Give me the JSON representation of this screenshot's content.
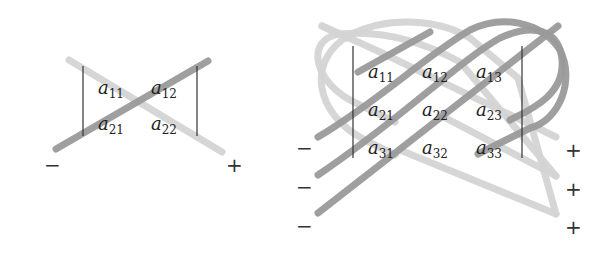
{
  "diagram_2x2": {
    "title": "2x2 determinant diagonals",
    "entries": [
      {
        "base": "a",
        "sub": "11"
      },
      {
        "base": "a",
        "sub": "12"
      },
      {
        "base": "a",
        "sub": "21"
      },
      {
        "base": "a",
        "sub": "22"
      }
    ],
    "minus_sign": "−",
    "plus_sign": "+"
  },
  "diagram_3x3": {
    "title": "3x3 determinant (Sarrus rule) diagonals",
    "entries": [
      {
        "base": "a",
        "sub": "11"
      },
      {
        "base": "a",
        "sub": "12"
      },
      {
        "base": "a",
        "sub": "13"
      },
      {
        "base": "a",
        "sub": "21"
      },
      {
        "base": "a",
        "sub": "22"
      },
      {
        "base": "a",
        "sub": "23"
      },
      {
        "base": "a",
        "sub": "31"
      },
      {
        "base": "a",
        "sub": "32"
      },
      {
        "base": "a",
        "sub": "33"
      }
    ],
    "minus_signs": [
      "−",
      "−",
      "−"
    ],
    "plus_signs": [
      "+",
      "+",
      "+"
    ]
  },
  "colors": {
    "negative_diagonal": "#9a9a9a",
    "positive_diagonal": "#d4d4d4",
    "text": "#222222"
  }
}
